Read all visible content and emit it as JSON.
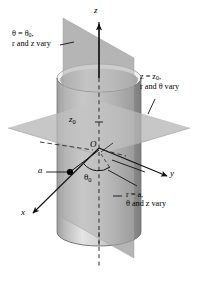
{
  "figure": {
    "background_color": "#ffffff",
    "ink_color": "#000000",
    "axes": {
      "z": {
        "label": "z",
        "direction": "up"
      },
      "y": {
        "label": "y",
        "direction": "right"
      },
      "x": {
        "label": "x",
        "direction": "lower-left"
      }
    },
    "origin": {
      "label": "O"
    },
    "marks": {
      "z0": "z",
      "z0_sub": "0",
      "theta0": "θ",
      "theta0_sub": "0",
      "radius_a": "a"
    },
    "annotations": {
      "plane_theta": {
        "line1": "θ = θ",
        "line1_sub": "0",
        "line1_tail": ",",
        "line2": "r and z vary"
      },
      "plane_z": {
        "line1": "z = z",
        "line1_sub": "0",
        "line1_tail": ",",
        "line2": "r and θ vary"
      },
      "cylinder_r": {
        "line1": "r = a",
        "line1_tail": ",",
        "line2": "θ and z vary"
      }
    },
    "colors": {
      "plane_vertical": "#b3b3b3",
      "plane_horizontal": "#c6c6c6",
      "cylinder_light": "#e8e8e8",
      "cylinder_mid": "#c8c8c8",
      "cylinder_dark": "#9a9a9a",
      "stroke": "#1a1a1a"
    }
  }
}
